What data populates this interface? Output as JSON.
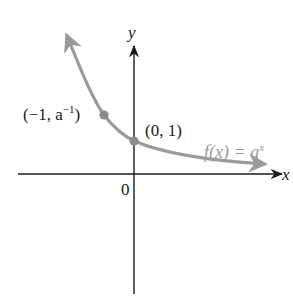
{
  "diagram": {
    "axes": {
      "x_label": "x",
      "y_label": "y",
      "origin_label": "0"
    },
    "curve": {
      "label_prefix": "f(x) = a",
      "label_exponent": "x",
      "color": "#9a9a9a",
      "description": "decreasing exponential curve, arrow up-left and arrow right approaching x-axis"
    },
    "points": [
      {
        "label_prefix": "(−1, a",
        "label_exponent": "−1",
        "label_suffix": ")",
        "x": -1,
        "y": "a^-1"
      },
      {
        "label": "(0, 1)",
        "x": 0,
        "y": 1
      }
    ],
    "colors": {
      "axis": "#1a1a1a",
      "curve": "#9a9a9a",
      "point": "#8c8c8c",
      "background": "#ffffff"
    }
  }
}
